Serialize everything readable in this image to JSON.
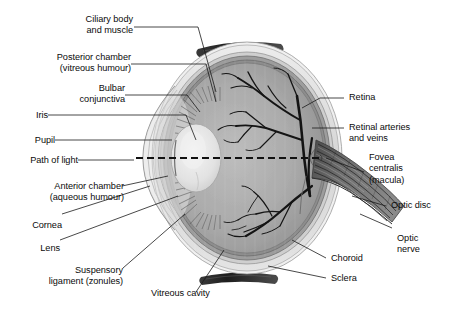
{
  "figure": {
    "kind": "anatomical-diagram",
    "background_color": "#ffffff",
    "label_color": "#0b0b0b",
    "leader_line_color": "#1a1a1a"
  },
  "labels_left": [
    {
      "name": "ciliary-body-and-muscle",
      "lines": [
        "Ciliary body",
        "and muscle"
      ]
    },
    {
      "name": "posterior-chamber",
      "lines": [
        "Posterior chamber",
        "(vitreous humour)"
      ]
    },
    {
      "name": "bulbar-conjunctiva",
      "lines": [
        "Bulbar",
        "conjunctiva"
      ]
    },
    {
      "name": "iris",
      "lines": [
        "Iris"
      ]
    },
    {
      "name": "pupil",
      "lines": [
        "Pupil"
      ]
    },
    {
      "name": "path-of-light",
      "lines": [
        "Path of light"
      ]
    },
    {
      "name": "anterior-chamber",
      "lines": [
        "Anterior chamber",
        "(aqueous humour)"
      ]
    },
    {
      "name": "cornea",
      "lines": [
        "Cornea"
      ]
    },
    {
      "name": "lens",
      "lines": [
        "Lens"
      ]
    },
    {
      "name": "suspensory-ligament",
      "lines": [
        "Suspensory",
        "ligament (zonules)"
      ]
    }
  ],
  "labels_right": [
    {
      "name": "retina",
      "lines": [
        "Retina"
      ]
    },
    {
      "name": "retinal-arteries-and-veins",
      "lines": [
        "Retinal arteries",
        "and veins"
      ]
    },
    {
      "name": "fovea-centralis",
      "lines": [
        "Fovea",
        "centralis",
        "(macula)"
      ]
    },
    {
      "name": "optic-disc",
      "lines": [
        "Optic disc"
      ]
    },
    {
      "name": "optic-nerve",
      "lines": [
        "Optic",
        "nerve"
      ]
    },
    {
      "name": "choroid",
      "lines": [
        "Choroid"
      ]
    },
    {
      "name": "sclera",
      "lines": [
        "Sclera"
      ]
    }
  ],
  "labels_bottom": [
    {
      "name": "vitreous-cavity",
      "lines": [
        "Vitreous cavity"
      ]
    }
  ],
  "structures": {
    "sclera_color": "#d8d8d8",
    "choroid_color": "#9a9a9a",
    "vitreous_color": "#a8a8a8",
    "lens_color": "#e8e8e8",
    "vessel_color": "#141414",
    "muscle_color": "#2a2a2a"
  }
}
